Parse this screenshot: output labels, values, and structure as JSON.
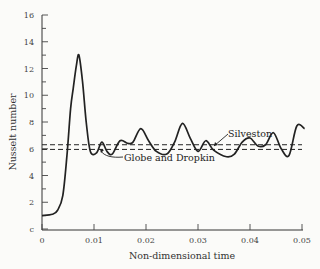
{
  "chart_data": {
    "type": "line",
    "title": "",
    "xlabel": "Non-dimensional time",
    "ylabel": "Nusselt number",
    "xlim": [
      0,
      0.05
    ],
    "ylim": [
      0,
      16
    ],
    "xticks": [
      0,
      0.01,
      0.02,
      0.03,
      0.04,
      0.05
    ],
    "xtick_labels": [
      "0",
      "0.01",
      "0.02",
      "0.03",
      "0.04",
      "0.05"
    ],
    "yticks": [
      0,
      2,
      4,
      6,
      8,
      10,
      12,
      14,
      16
    ],
    "ytick_labels": [
      "c",
      "2",
      "4",
      "6",
      "8",
      "10",
      "12",
      "14",
      "16"
    ],
    "grid": false,
    "legend": "none",
    "series": [
      {
        "name": "Computed Nusselt number",
        "style": "solid",
        "x": [
          0,
          0.002,
          0.003,
          0.004,
          0.0048,
          0.0055,
          0.006,
          0.0066,
          0.0071,
          0.0078,
          0.0085,
          0.0093,
          0.0105,
          0.0115,
          0.0125,
          0.0135,
          0.015,
          0.0165,
          0.0175,
          0.019,
          0.0205,
          0.022,
          0.024,
          0.0255,
          0.027,
          0.0285,
          0.03,
          0.0315,
          0.033,
          0.0355,
          0.037,
          0.0385,
          0.04,
          0.0415,
          0.043,
          0.0445,
          0.046,
          0.0475,
          0.049,
          0.0505
        ],
        "y": [
          1.0,
          1.1,
          1.4,
          2.5,
          5.5,
          9.0,
          10.5,
          12.2,
          13.0,
          11.0,
          8.0,
          5.8,
          5.7,
          6.5,
          5.8,
          5.6,
          6.6,
          6.4,
          6.5,
          7.5,
          6.6,
          5.8,
          5.6,
          6.5,
          7.9,
          6.8,
          5.8,
          6.6,
          5.9,
          5.4,
          5.6,
          6.5,
          6.8,
          6.2,
          6.3,
          7.2,
          6.0,
          5.5,
          7.7,
          7.5
        ]
      },
      {
        "name": "Silveston",
        "style": "dashed",
        "x": [
          0,
          0.05
        ],
        "y": [
          6.3,
          6.3
        ]
      },
      {
        "name": "Globe and Dropkin",
        "style": "dashed",
        "x": [
          0,
          0.05
        ],
        "y": [
          5.95,
          5.95
        ]
      }
    ],
    "annotations": [
      {
        "text": "Silveston",
        "x": 0.0315,
        "y": 7.1
      },
      {
        "text": "Globe and Dropkin",
        "x": 0.0135,
        "y": 5.0
      }
    ]
  },
  "labels": {
    "xlabel": "Non-dimensional time",
    "ylabel": "Nusselt number",
    "silveston": "Silveston",
    "globe": "Globe and Dropkin"
  }
}
